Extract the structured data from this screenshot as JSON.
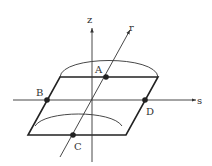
{
  "axes": {
    "z": "z",
    "r": "r",
    "s": "s"
  },
  "points": {
    "A": "A",
    "B": "B",
    "C": "C",
    "D": "D"
  },
  "colors": {
    "line": "#333333",
    "point": "#222222"
  }
}
